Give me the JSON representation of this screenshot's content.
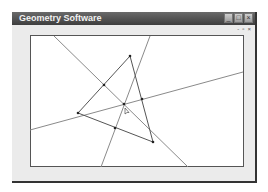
{
  "window": {
    "title": "Geometry Software",
    "controls": {
      "minimize": "_",
      "maximize": "□",
      "close": "×"
    },
    "doc_controls": {
      "minimize": "-",
      "restore": "▫",
      "close": "×"
    }
  },
  "canvas": {
    "colors": {
      "line": "#8a8a8a",
      "point": "#222222"
    },
    "lines": [
      {
        "x1": 54,
        "y1": 36,
        "x2": 188,
        "y2": 167
      },
      {
        "x1": 150,
        "y1": 36,
        "x2": 101,
        "y2": 167
      },
      {
        "x1": 30,
        "y1": 130,
        "x2": 243,
        "y2": 72
      }
    ],
    "triangle": [
      [
        130,
        56
      ],
      [
        78,
        113
      ],
      [
        153,
        142
      ]
    ],
    "points": [
      [
        130,
        56
      ],
      [
        78,
        113
      ],
      [
        153,
        142
      ],
      [
        104,
        85
      ],
      [
        142,
        99
      ],
      [
        115,
        128
      ],
      [
        124,
        104
      ]
    ],
    "cursor": {
      "x": 125,
      "y": 108
    }
  }
}
